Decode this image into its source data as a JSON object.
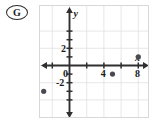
{
  "badge": {
    "letter": "G",
    "shape": "ellipse-outline"
  },
  "chart_data": {
    "type": "scatter",
    "title": "",
    "xlabel": "x",
    "ylabel": "y",
    "grid": true,
    "legend": false,
    "xlim": [
      -5,
      14
    ],
    "ylim": [
      -4.5,
      4.5
    ],
    "x_tick_interval": 2,
    "y_tick_interval": 1,
    "x_tick_labels": [
      "0",
      "4",
      "8"
    ],
    "x_tick_label_values": [
      0,
      4,
      8
    ],
    "y_tick_labels": [
      "2",
      "-2"
    ],
    "y_tick_label_values": [
      2,
      -2
    ],
    "origin_label": "0",
    "points": [
      {
        "x": -3,
        "y": -3
      },
      {
        "x": 5,
        "y": -1
      },
      {
        "x": 8,
        "y": 1
      },
      {
        "x": 12,
        "y": 3.5
      }
    ],
    "point_color": "#4a4a52",
    "grid_color": "#dcdcdc",
    "axis_color": "#2f2f2f"
  }
}
